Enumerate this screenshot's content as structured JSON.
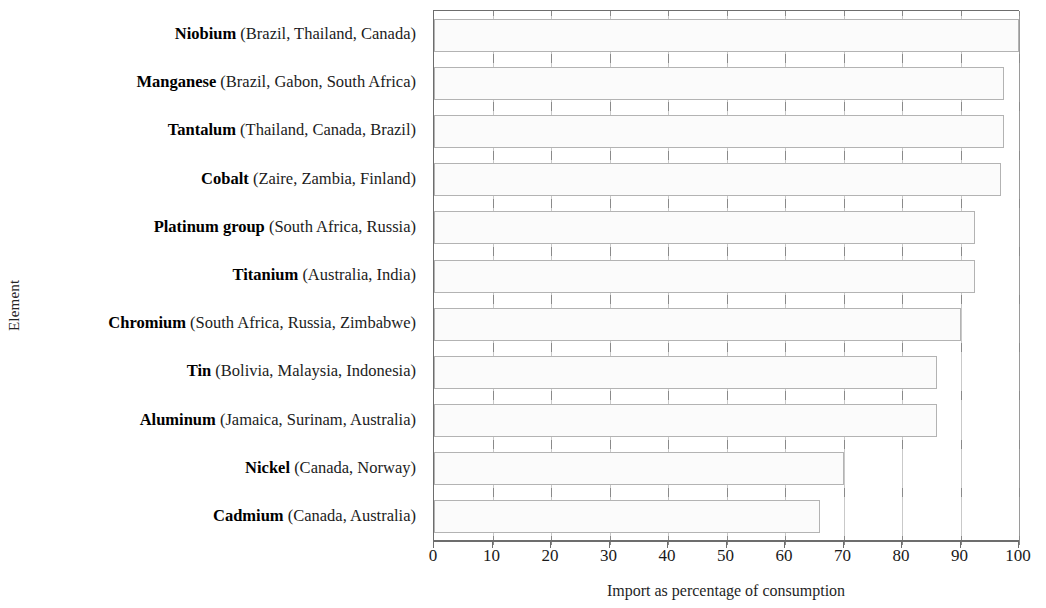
{
  "chart_data": {
    "type": "bar",
    "orientation": "horizontal",
    "title": "",
    "xlabel": "Import as percentage of consumption",
    "ylabel": "Element",
    "xlim": [
      0,
      100
    ],
    "xticks": [
      0,
      10,
      20,
      30,
      40,
      50,
      60,
      70,
      80,
      90,
      100
    ],
    "xtick_labels": [
      "0",
      "10",
      "20",
      "30",
      "40",
      "50",
      "60",
      "70",
      "80",
      "90",
      "100"
    ],
    "grid": true,
    "legend": null,
    "categories": [
      "Niobium (Brazil, Thailand, Canada)",
      "Manganese (Brazil, Gabon, South Africa)",
      "Tantalum (Thailand, Canada, Brazil)",
      "Cobalt (Zaire, Zambia, Finland)",
      "Platinum group (South Africa, Russia)",
      "Titanium (Australia, India)",
      "Chromium (South Africa, Russia, Zimbabwe)",
      "Tin (Bolivia, Malaysia, Indonesia)",
      "Aluminum (Jamaica, Surinam, Australia)",
      "Nickel (Canada, Norway)",
      "Cadmium (Canada, Australia)"
    ],
    "values": [
      100,
      97.5,
      97.5,
      97,
      92.5,
      92.5,
      90,
      86,
      86,
      70,
      66
    ],
    "bar_facecolor": "#fbfbfb",
    "bar_edgecolor": "#b3b3b3",
    "axis_color": "#6d6d6d",
    "grid_color": "#c9c9c9"
  },
  "axes": {
    "y_title": "Element",
    "x_title": "Import as percentage of consumption"
  },
  "rows": [
    {
      "element": "Niobium",
      "countries": "(Brazil, Thailand, Canada)",
      "value": 100
    },
    {
      "element": "Manganese",
      "countries": "(Brazil, Gabon, South Africa)",
      "value": 97.5
    },
    {
      "element": "Tantalum",
      "countries": "(Thailand, Canada, Brazil)",
      "value": 97.5
    },
    {
      "element": "Cobalt",
      "countries": "(Zaire, Zambia, Finland)",
      "value": 97
    },
    {
      "element": "Platinum group",
      "countries": "(South Africa, Russia)",
      "value": 92.5
    },
    {
      "element": "Titanium",
      "countries": "(Australia, India)",
      "value": 92.5
    },
    {
      "element": "Chromium",
      "countries": "(South Africa, Russia, Zimbabwe)",
      "value": 90
    },
    {
      "element": "Tin",
      "countries": "(Bolivia, Malaysia, Indonesia)",
      "value": 86
    },
    {
      "element": "Aluminum",
      "countries": "(Jamaica, Surinam, Australia)",
      "value": 86
    },
    {
      "element": "Nickel",
      "countries": "(Canada, Norway)",
      "value": 70
    },
    {
      "element": "Cadmium",
      "countries": "(Canada, Australia)",
      "value": 66
    }
  ]
}
